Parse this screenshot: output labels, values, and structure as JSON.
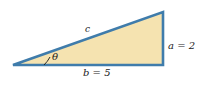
{
  "figure": {
    "type": "right-triangle-diagram",
    "background_color": "#ffffff",
    "fill_color": "#f5e3b0",
    "stroke_color": "#3f7cab",
    "label_color": "#1a1a1a",
    "vertices": {
      "left": [
        13,
        65
      ],
      "bottom_right": [
        163,
        65
      ],
      "top_right": [
        163,
        12
      ]
    },
    "labels": {
      "hypotenuse": "c",
      "opposite_side": "a = 2",
      "adjacent_side": "b = 5",
      "angle": "θ"
    },
    "values": {
      "a": 2,
      "b": 5
    }
  }
}
